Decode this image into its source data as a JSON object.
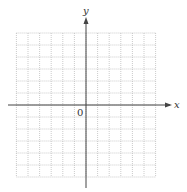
{
  "diagram": {
    "type": "coordinate-grid",
    "x_axis_label": "x",
    "y_axis_label": "y",
    "origin_label": "0",
    "grid": {
      "columns_left_of_y_axis": 6,
      "columns_right_of_y_axis": 6,
      "rows_above_x_axis": 6,
      "rows_below_x_axis": 6,
      "line_style": "dotted"
    },
    "colors": {
      "grid": "#b5b5b5",
      "axis": "#444444",
      "text": "#333333"
    }
  }
}
